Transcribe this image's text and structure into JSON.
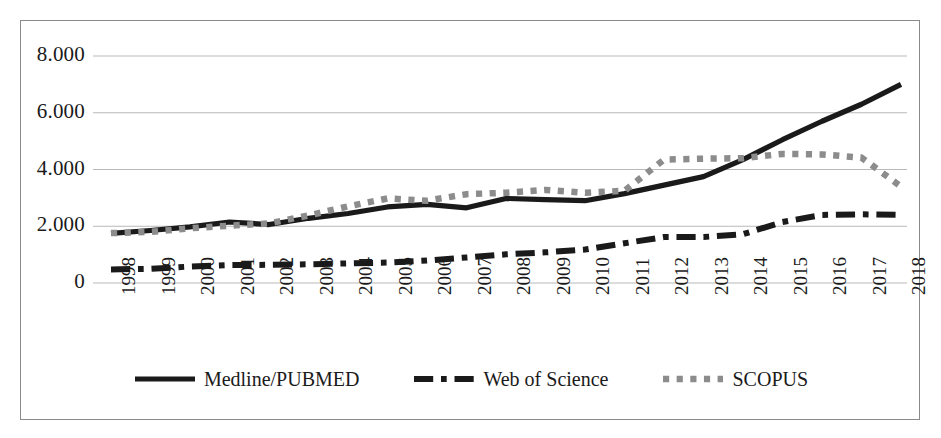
{
  "chart_data": {
    "type": "line",
    "title": "",
    "xlabel": "",
    "ylabel": "",
    "categories": [
      "1998",
      "1999",
      "2000",
      "2001",
      "2002",
      "2003",
      "2004",
      "2005",
      "2006",
      "2007",
      "2008",
      "2009",
      "2010",
      "2011",
      "2012",
      "2013",
      "2014",
      "2015",
      "2016",
      "2017",
      "2018"
    ],
    "ylim": [
      0,
      8000
    ],
    "yticks": [
      0,
      2000,
      4000,
      6000,
      8000
    ],
    "ytick_labels": [
      "0",
      "2.000",
      "4.000",
      "6.000",
      "8.000"
    ],
    "grid": true,
    "legend_position": "bottom",
    "series": [
      {
        "name": "Medline/PUBMED",
        "style": "solid",
        "color": "#1a1a1a",
        "values": [
          1750,
          1850,
          1980,
          2150,
          2060,
          2280,
          2450,
          2680,
          2770,
          2650,
          2980,
          2940,
          2900,
          3150,
          3450,
          3750,
          4350,
          5050,
          5700,
          6300,
          7000
        ]
      },
      {
        "name": "Web of Science",
        "style": "dash-dot",
        "color": "#1a1a1a",
        "values": [
          480,
          500,
          580,
          630,
          640,
          660,
          690,
          720,
          790,
          900,
          1010,
          1080,
          1180,
          1400,
          1620,
          1620,
          1720,
          2150,
          2400,
          2420,
          2400
        ]
      },
      {
        "name": "SCOPUS",
        "style": "dotted",
        "color": "#8c8c8c",
        "values": [
          1760,
          1800,
          1930,
          2020,
          2100,
          2380,
          2700,
          2980,
          2900,
          3130,
          3180,
          3280,
          3180,
          3250,
          4350,
          4380,
          4400,
          4550,
          4530,
          4420,
          3400
        ]
      }
    ]
  },
  "legend": {
    "items": [
      {
        "label": "Medline/PUBMED",
        "style": "solid",
        "color": "#1a1a1a"
      },
      {
        "label": "Web of Science",
        "style": "dash-dot",
        "color": "#1a1a1a"
      },
      {
        "label": "SCOPUS",
        "style": "dotted",
        "color": "#8c8c8c"
      }
    ]
  }
}
